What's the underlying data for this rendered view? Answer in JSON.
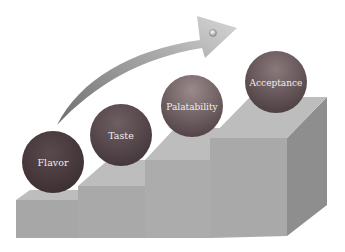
{
  "diagram": {
    "steps": [
      {
        "label": "Flavor"
      },
      {
        "label": "Taste"
      },
      {
        "label": "Palatability"
      },
      {
        "label": "Acceptance"
      }
    ],
    "arrow": {
      "direction": "upward-right",
      "meaning": "increasing progression"
    },
    "colors": {
      "ball_dark": "#4a3a3e",
      "ball_mid": "#6b5a5c",
      "ball_light": "#8a7a7b",
      "stair_top": "#b8b8b8",
      "stair_front": "#a8a8a8",
      "stair_side": "#8f8f8f",
      "arrow_light": "#cfcfcf",
      "arrow_dark": "#7a7a7a"
    }
  }
}
